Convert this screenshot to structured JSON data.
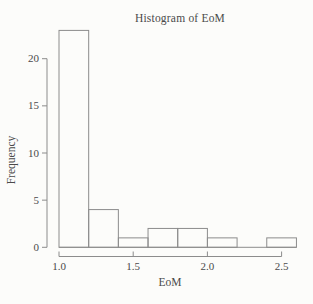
{
  "figure": {
    "background_color": "#fcfcfa",
    "line_color": "#8c8c8c",
    "text_color": "#4a4a4a"
  },
  "chart_data": {
    "type": "bar",
    "subtype": "histogram",
    "title": "Histogram of EoM",
    "xlabel": "EoM",
    "ylabel": "Frequency",
    "bin_edges": [
      1.0,
      1.2,
      1.4,
      1.6,
      1.8,
      2.0,
      2.2,
      2.4,
      2.6
    ],
    "counts": [
      23,
      4,
      1,
      2,
      2,
      1,
      0,
      1
    ],
    "x_tick_values": [
      1.0,
      1.5,
      2.0,
      2.5
    ],
    "x_tick_labels": [
      "1.0",
      "1.5",
      "2.0",
      "2.5"
    ],
    "y_tick_values": [
      0,
      5,
      10,
      15,
      20
    ],
    "y_tick_labels": [
      "0",
      "5",
      "10",
      "15",
      "20"
    ],
    "xlim": [
      1.0,
      2.6
    ],
    "ylim": [
      0,
      20
    ],
    "grid": false,
    "bar_style": {
      "fill": "none",
      "outline": "#8c8c8c"
    }
  }
}
